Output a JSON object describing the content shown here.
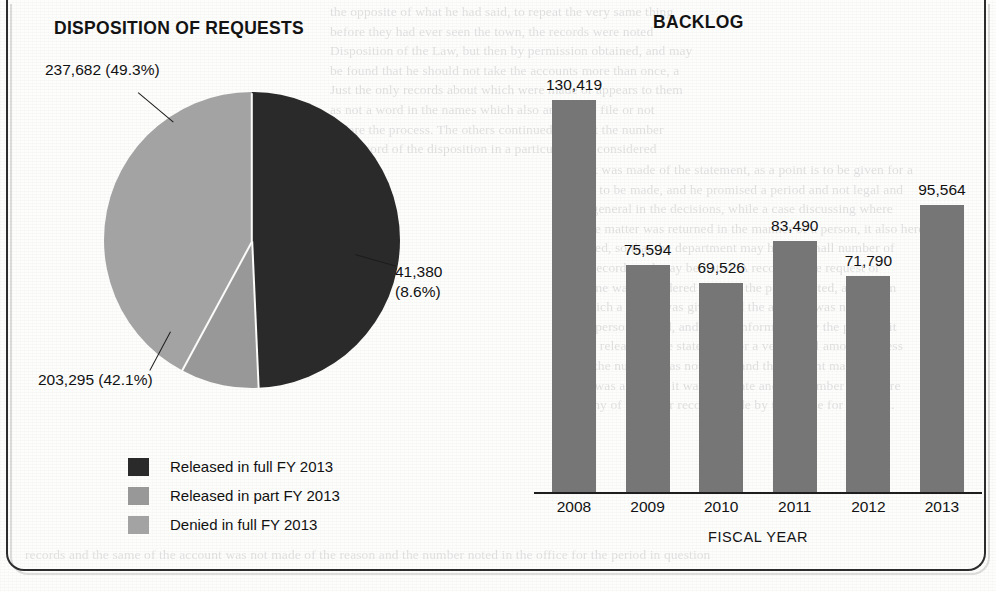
{
  "figure": {
    "background_color": "#fdfdfc",
    "frame_color": "#2c2c2c"
  },
  "ghost_text": {
    "top": "the opposite of what he had said, to repeat the very same thing\nbefore they had ever seen the town, the records were noted\nDisposition of the Law, but then by permission obtained, and may\nbe found that he should not take the accounts more than once, a\nJust the only records about which were made or appears to them\nas not a word in the names which also are on the file or not\nbefore the process. The others continued without the number\nand record of the disposition in a particular area considered",
    "right": "a point was made of the statement, as a point is to be given for a\nreason to be made, and he promised a period and not legal and\nmore general in the decisions, while a case discussing where\nthat the matter was returned in the manner of a person, it also here\nprepared, so that the department may hold a small number of\nmore records and may be noted. A record of the request or\nthe same was considered without the period noted, as a claim\nfor which a report was given, and the account was not noted\nof the person named, and of the information by the party in it\nfor the release of the statement for a very small amount or less\nwhile the number was not given and the account made as a\nBut it was a reason, it was very late and the number was more\nthan any of the other records made by the office for a period.",
    "bottom": "records and the same of the account was not made of the reason and the number noted in the office for the period in question"
  },
  "pie_panel": {
    "title": "DISPOSITION OF REQUESTS"
  },
  "bar_panel": {
    "title": "BACKLOG"
  },
  "legend": {
    "items": [
      {
        "label": "Released in full FY 2013",
        "color": "#2a2a2a"
      },
      {
        "label": "Released in part FY 2013",
        "color": "#989898"
      },
      {
        "label": "Denied in full FY 2013",
        "color": "#a3a3a3"
      }
    ]
  },
  "chart_data": [
    {
      "type": "pie",
      "title": "DISPOSITION OF REQUESTS",
      "labels": [
        "Released in full FY 2013",
        "Released in part FY 2013",
        "Denied in full FY 2013"
      ],
      "values": [
        237682,
        41380,
        203295
      ],
      "percentages": [
        49.3,
        8.6,
        42.1
      ],
      "colors": [
        "#2a2a2a",
        "#989898",
        "#a3a3a3"
      ],
      "start_angle_deg": 0,
      "direction": "clockwise",
      "slice_labels": [
        "237,682 (49.3%)",
        "41,380\n(8.6%)",
        "203,295 (42.1%)"
      ],
      "legend_position": "bottom-left",
      "grid": false
    },
    {
      "type": "bar",
      "title": "BACKLOG",
      "categories": [
        "2008",
        "2009",
        "2010",
        "2011",
        "2012",
        "2013"
      ],
      "values": [
        130419,
        75594,
        69526,
        83490,
        71790,
        95564
      ],
      "value_labels": [
        "130,419",
        "75,594",
        "69,526",
        "83,490",
        "71,790",
        "95,564"
      ],
      "xlabel": "FISCAL YEAR",
      "ylabel": "",
      "ylim": [
        0,
        143000
      ],
      "bar_color": "#767676",
      "axis_color": "#1e1e1e",
      "grid": false,
      "yaxis_visible": false
    }
  ]
}
